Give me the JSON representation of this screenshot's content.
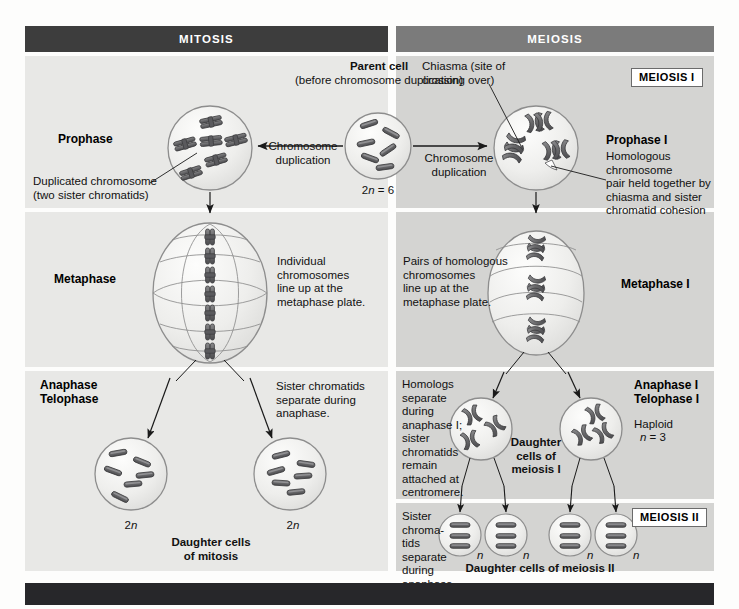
{
  "figure": {
    "title_left": "MITOSIS",
    "title_right": "MEIOSIS",
    "meiosis_i_badge": "MEIOSIS I",
    "meiosis_ii_badge": "MEIOSIS II"
  },
  "colors": {
    "header_left_bg": "#3d3d3d",
    "header_right_bg": "#7b7b7b",
    "panel_left_bg": "#e8e8e6",
    "panel_right_bg": "#d4d4d2",
    "chromosome_fill": "#6e6e70",
    "chromosome_stroke": "#3a3a3c",
    "cell_fill": "#ececea",
    "cell_stroke": "#8d8d8d",
    "footer_bg": "#27272a",
    "text": "#111111"
  },
  "parent": {
    "title": "Parent cell",
    "subtitle": "(before chromosome duplication)",
    "ploidy": "2n = 6",
    "chromosome_count": 6
  },
  "mitosis": {
    "prophase": {
      "label": "Prophase",
      "callout": "Duplicated chromosome\n(two sister chromatids)",
      "arrow_label": "Chromosome\nduplication",
      "chromosome_count": 6
    },
    "metaphase": {
      "label": "Metaphase",
      "note": "Individual\nchromosomes\nline up at the\nmetaphase plate.",
      "chromosome_count": 8
    },
    "anaphase": {
      "label": "Anaphase\nTelophase",
      "note": "Sister chromatids\nseparate during\nanaphase."
    },
    "daughters": {
      "caption": "Daughter cells\nof mitosis",
      "ploidy_left": "2n",
      "ploidy_right": "2n",
      "chromosomes_per_cell": 6,
      "count": 2
    }
  },
  "meiosis": {
    "prophase_i": {
      "label": "Prophase I",
      "arrow_label": "Chromosome\nduplication",
      "chiasma_callout": "Chiasma (site of\ncrossing over)",
      "homolog_callout": "Homologous chromosome\npair held together by\nchiasma and sister\nchromatid cohesion",
      "tetrad_count": 3
    },
    "metaphase_i": {
      "label": "Metaphase I",
      "note": "Pairs of homologous\nchromosomes\nline up at the\nmetaphase plate.",
      "tetrad_count": 3
    },
    "anaphase_i": {
      "label": "Anaphase I\nTelophase I",
      "note": "Homologs\nseparate\nduring\nanaphase I;\nsister\nchromatids\nremain\nattached at\ncentromere.",
      "haploid_label": "Haploid",
      "haploid_value": "n = 3",
      "daughter_caption": "Daughter\ncells of\nmeiosis I",
      "chromosomes_per_cell": 3,
      "count": 2
    },
    "meiosis_ii": {
      "note": "Sister\nchroma-\ntids\nseparate\nduring\nanaphase II.",
      "caption": "Daughter cells of meiosis II",
      "ploidy_marks": [
        "n",
        "n",
        "n",
        "n"
      ],
      "chromosomes_per_cell": 3,
      "count": 4
    }
  }
}
